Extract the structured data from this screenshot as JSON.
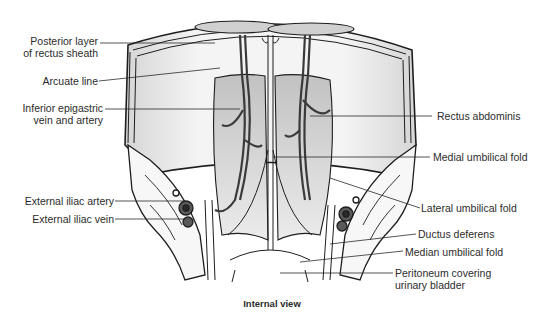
{
  "figure": {
    "caption": "Internal view",
    "labels_left": [
      {
        "id": "posterior-layer",
        "line1": "Posterior layer",
        "line2": "of rectus sheath"
      },
      {
        "id": "arcuate-line",
        "line1": "Arcuate line"
      },
      {
        "id": "inferior-epigastric",
        "line1": "Inferior epigastric",
        "line2": "vein and artery"
      },
      {
        "id": "external-iliac-artery",
        "line1": "External iliac artery"
      },
      {
        "id": "external-iliac-vein",
        "line1": "External iliac vein"
      }
    ],
    "labels_right": [
      {
        "id": "rectus-abdominis",
        "line1": "Rectus abdominis"
      },
      {
        "id": "medial-umbilical-fold",
        "line1": "Medial umbilical fold"
      },
      {
        "id": "lateral-umbilical-fold",
        "line1": "Lateral umbilical fold"
      },
      {
        "id": "ductus-deferens",
        "line1": "Ductus deferens"
      },
      {
        "id": "median-umbilical-fold",
        "line1": "Median umbilical fold"
      },
      {
        "id": "peritoneum-bladder",
        "line1": "Peritoneum covering",
        "line2": "urinary bladder"
      }
    ],
    "colors": {
      "ink": "#1e1e1e",
      "shade": "#cfcfcf",
      "shade_dark": "#9a9a9a",
      "background": "#ffffff"
    }
  }
}
